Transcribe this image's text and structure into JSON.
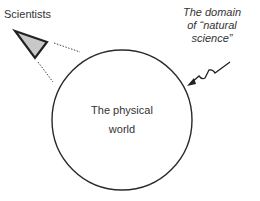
{
  "labels": {
    "scientists": "Scientists",
    "domain_line1": "The domain",
    "domain_line2": "of “natural",
    "domain_line3": "science”",
    "world_line1": "The physical",
    "world_line2": "world"
  },
  "colors": {
    "stroke": "#2a2a2a",
    "eye_fill": "#c8c8c8",
    "text": "#333333"
  }
}
